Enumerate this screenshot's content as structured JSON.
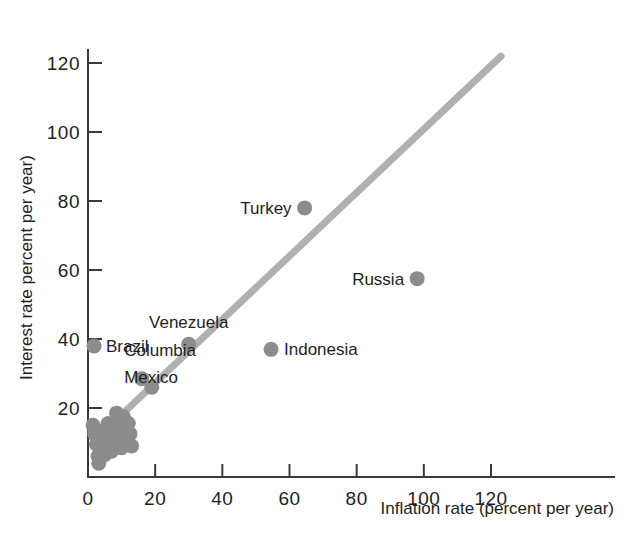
{
  "chart_data": {
    "type": "scatter",
    "title": "",
    "xlabel": "Inflation rate (percent per year)",
    "ylabel": "Interest rate percent per year)",
    "xlim": [
      0,
      128
    ],
    "ylim": [
      0,
      128
    ],
    "xticks": [
      0,
      20,
      40,
      60,
      80,
      100,
      120
    ],
    "yticks": [
      20,
      40,
      60,
      80,
      100,
      120
    ],
    "xtick_labels": [
      "0",
      "20",
      "40",
      "60",
      "80",
      "100",
      "120"
    ],
    "ytick_labels": [
      "20",
      "40",
      "60",
      "80",
      "100",
      "120"
    ],
    "grid": false,
    "legend": false,
    "point_color": "#8c8c8c",
    "line_color": "#b0b0b0",
    "axis_color": "#3a3a3a",
    "trendline": {
      "label": "45-degree reference line",
      "x0": 11,
      "y0": 19,
      "x1": 123,
      "y1": 122
    },
    "labeled_points": [
      {
        "name": "Turkey",
        "x": 64.5,
        "y": 78.0,
        "label_side": "left"
      },
      {
        "name": "Russia",
        "x": 98.0,
        "y": 57.5,
        "label_side": "left"
      },
      {
        "name": "Venezuela",
        "x": 30.0,
        "y": 38.5,
        "label_side": "above"
      },
      {
        "name": "Indonesia",
        "x": 54.5,
        "y": 37.0,
        "label_side": "right"
      },
      {
        "name": "Brazil",
        "x": 1.8,
        "y": 38.0,
        "label_side": "right"
      },
      {
        "name": "Columbia",
        "x": 16.0,
        "y": 28.5,
        "label_side": "labelonly"
      },
      {
        "name": "Mexico",
        "x": 19.0,
        "y": 26.0,
        "label_side": "labelonly"
      }
    ],
    "unlabeled_points": [
      {
        "x": 1.5,
        "y": 15.0
      },
      {
        "x": 2.0,
        "y": 12.5
      },
      {
        "x": 2.5,
        "y": 9.5
      },
      {
        "x": 3.0,
        "y": 6.0
      },
      {
        "x": 3.2,
        "y": 4.0
      },
      {
        "x": 4.0,
        "y": 8.0
      },
      {
        "x": 4.2,
        "y": 11.0
      },
      {
        "x": 4.8,
        "y": 13.5
      },
      {
        "x": 5.0,
        "y": 6.5
      },
      {
        "x": 5.5,
        "y": 9.0
      },
      {
        "x": 6.0,
        "y": 15.5
      },
      {
        "x": 6.5,
        "y": 11.5
      },
      {
        "x": 7.0,
        "y": 7.5
      },
      {
        "x": 7.5,
        "y": 13.0
      },
      {
        "x": 8.0,
        "y": 9.5
      },
      {
        "x": 8.5,
        "y": 18.5
      },
      {
        "x": 9.0,
        "y": 12.0
      },
      {
        "x": 9.5,
        "y": 15.0
      },
      {
        "x": 10.0,
        "y": 8.5
      },
      {
        "x": 10.5,
        "y": 17.5
      },
      {
        "x": 11.0,
        "y": 13.0
      },
      {
        "x": 11.5,
        "y": 10.5
      },
      {
        "x": 12.0,
        "y": 15.5
      },
      {
        "x": 12.5,
        "y": 12.5
      },
      {
        "x": 13.0,
        "y": 9.0
      }
    ]
  },
  "axes": {
    "x_title": "Inflation rate (percent per year)",
    "y_title": "Interest rate percent per year)"
  }
}
